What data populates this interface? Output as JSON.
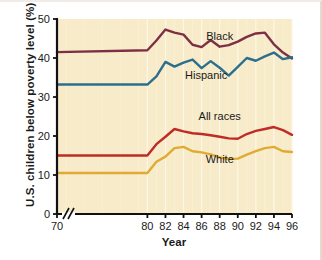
{
  "figure": {
    "background": "#ffffff",
    "plot_background": "#f7ebc9",
    "gridline_color": "#fdf7e4"
  },
  "chart_data": {
    "type": "line",
    "title": "",
    "xlabel": "Year",
    "ylabel": "U.S. children below poverty level (%)",
    "xlim": [
      70,
      96
    ],
    "ylim": [
      0,
      50
    ],
    "yticks": [
      0,
      10,
      20,
      30,
      40,
      50
    ],
    "xticks": [
      70,
      80,
      82,
      84,
      86,
      88,
      90,
      92,
      94,
      96
    ],
    "axis_break": {
      "between": [
        70,
        80
      ],
      "symbol": "//"
    },
    "grid": "vertical-only",
    "legend": "inline-labels",
    "x": [
      70,
      80,
      81,
      82,
      83,
      84,
      85,
      86,
      87,
      88,
      89,
      90,
      91,
      92,
      93,
      94,
      95,
      96
    ],
    "series": [
      {
        "name": "Black",
        "color": "#7d3043",
        "label": "Black",
        "values": [
          41.5,
          42.0,
          44.5,
          47.3,
          46.5,
          46.0,
          43.4,
          42.8,
          44.6,
          42.9,
          43.3,
          44.2,
          45.4,
          46.3,
          46.5,
          43.5,
          41.4,
          39.9
        ]
      },
      {
        "name": "Hispanic",
        "color": "#2c6f8c",
        "label": "Hispanic",
        "values": [
          33.2,
          33.2,
          35.3,
          39.0,
          37.8,
          38.8,
          39.6,
          37.4,
          39.2,
          37.5,
          35.5,
          37.7,
          40.0,
          39.3,
          40.4,
          41.4,
          39.7,
          40.2
        ]
      },
      {
        "name": "All races",
        "color": "#bf2b26",
        "label": "All races",
        "values": [
          15.0,
          15.0,
          17.9,
          19.8,
          21.8,
          21.2,
          20.7,
          20.5,
          20.2,
          19.8,
          19.4,
          19.3,
          20.5,
          21.3,
          21.8,
          22.3,
          21.5,
          20.3
        ]
      },
      {
        "name": "White",
        "color": "#e0ab34",
        "label": "White",
        "values": [
          10.5,
          10.5,
          13.4,
          14.7,
          16.9,
          17.2,
          16.1,
          15.8,
          15.3,
          14.5,
          14.1,
          14.2,
          15.2,
          16.1,
          16.9,
          17.2,
          16.1,
          15.9
        ]
      }
    ]
  }
}
